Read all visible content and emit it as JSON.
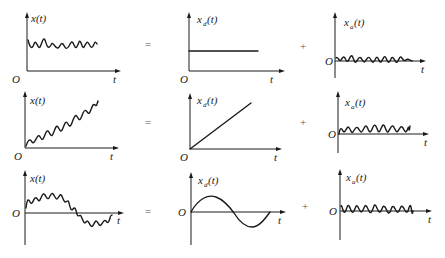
{
  "operators": {
    "equals": "=",
    "plus": "+"
  },
  "labels": {
    "origin": "O",
    "time": "t",
    "signal": "x(t)",
    "det_base": "x",
    "det_sub": "d",
    "rand_base": "x",
    "rand_sub": "a",
    "arg": "(t)"
  },
  "rows": [
    {
      "name": "constant-trend",
      "total": {
        "description": "constant level with noise",
        "shape": "offset-noise"
      },
      "deterministic": {
        "description": "constant (horizontal line)",
        "shape": "constant"
      },
      "random": {
        "description": "zero-mean noise",
        "shape": "noise"
      }
    },
    {
      "name": "linear-trend",
      "total": {
        "description": "rising ramp with noise",
        "shape": "ramp-noise"
      },
      "deterministic": {
        "description": "linear ramp from origin",
        "shape": "ramp"
      },
      "random": {
        "description": "zero-mean noise",
        "shape": "noise"
      }
    },
    {
      "name": "periodic-trend",
      "total": {
        "description": "sine wave with noise",
        "shape": "sine-noise"
      },
      "deterministic": {
        "description": "one period of a sine wave",
        "shape": "sine"
      },
      "random": {
        "description": "zero-mean noise",
        "shape": "noise"
      }
    }
  ]
}
